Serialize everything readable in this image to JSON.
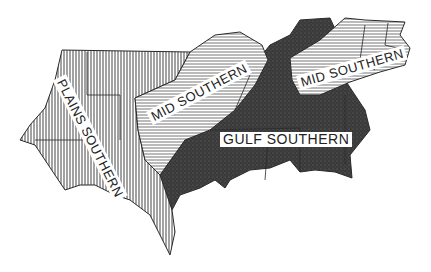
{
  "map": {
    "type": "dialect-region-map",
    "regions": [
      {
        "id": "plains-southern",
        "label": "PLAINS SOUTHERN",
        "fill": "vertical-hatch"
      },
      {
        "id": "mid-southern-west",
        "label": "MID SOUTHERN",
        "fill": "horizontal-hatch"
      },
      {
        "id": "mid-southern-east",
        "label": "MID SOUTHERN",
        "fill": "horizontal-hatch"
      },
      {
        "id": "gulf-southern",
        "label": "GULF SOUTHERN",
        "fill": "dark-stipple"
      }
    ],
    "colors": {
      "line": "#2a2a2a",
      "hatch": "#555555",
      "dark": "#3a3a3a",
      "background": "#ffffff"
    }
  }
}
